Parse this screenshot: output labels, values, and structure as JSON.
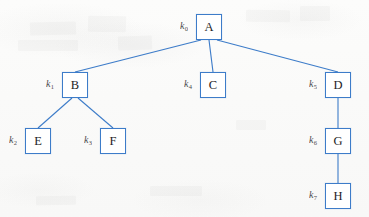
{
  "figure": {
    "accent_color": "#3d7cc9",
    "background_color": "#fbfbfa",
    "text_color": "#1d1d1f"
  },
  "nodes": [
    {
      "id": "A",
      "label": "A",
      "key": "k",
      "key_index": "0",
      "x": 196,
      "y": 14
    },
    {
      "id": "B",
      "label": "B",
      "key": "k",
      "key_index": "1",
      "x": 62,
      "y": 72
    },
    {
      "id": "C",
      "label": "C",
      "key": "k",
      "key_index": "4",
      "x": 200,
      "y": 72
    },
    {
      "id": "D",
      "label": "D",
      "key": "k",
      "key_index": "5",
      "x": 325,
      "y": 72
    },
    {
      "id": "E",
      "label": "E",
      "key": "k",
      "key_index": "2",
      "x": 25,
      "y": 128
    },
    {
      "id": "F",
      "label": "F",
      "key": "k",
      "key_index": "3",
      "x": 100,
      "y": 128
    },
    {
      "id": "G",
      "label": "G",
      "key": "k",
      "key_index": "6",
      "x": 325,
      "y": 128
    },
    {
      "id": "H",
      "label": "H",
      "key": "k",
      "key_index": "7",
      "x": 325,
      "y": 183
    }
  ],
  "edges": [
    {
      "from": "A",
      "to": "B",
      "x1": 201,
      "y1": 40,
      "x2": 75,
      "y2": 72
    },
    {
      "from": "A",
      "to": "C",
      "x1": 209,
      "y1": 40,
      "x2": 213,
      "y2": 72
    },
    {
      "from": "A",
      "to": "D",
      "x1": 217,
      "y1": 40,
      "x2": 338,
      "y2": 72
    },
    {
      "from": "B",
      "to": "E",
      "x1": 72,
      "y1": 98,
      "x2": 38,
      "y2": 128
    },
    {
      "from": "B",
      "to": "F",
      "x1": 78,
      "y1": 98,
      "x2": 113,
      "y2": 128
    },
    {
      "from": "D",
      "to": "G",
      "x1": 338,
      "y1": 98,
      "x2": 338,
      "y2": 128
    },
    {
      "from": "G",
      "to": "H",
      "x1": 338,
      "y1": 154,
      "x2": 338,
      "y2": 183
    }
  ]
}
